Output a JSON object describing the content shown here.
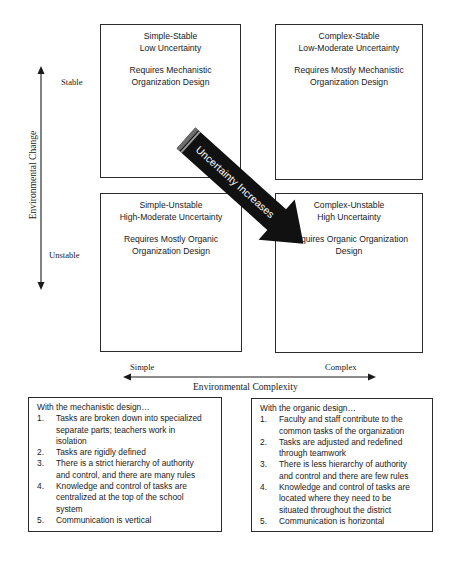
{
  "quadrants": {
    "simple_stable": {
      "title_line1": "Simple-Stable",
      "title_line2": "Low Uncertainty",
      "req_line1": "Requires Mechanistic",
      "req_line2": "Organization Design"
    },
    "complex_stable": {
      "title_line1": "Complex-Stable",
      "title_line2": "Low-Moderate Uncertainty",
      "req_line1": "Requires Mostly Mechanistic",
      "req_line2": "Organization Design"
    },
    "simple_unstable": {
      "title_line1": "Simple-Unstable",
      "title_line2": "High-Moderate Uncertainty",
      "req_line1": "Requires Mostly Organic",
      "req_line2": "Organization Design"
    },
    "complex_unstable": {
      "title_line1": "Complex-Unstable",
      "title_line2": "High Uncertainty",
      "req_line1": "Requires Organic Organization",
      "req_line2": "Design"
    }
  },
  "vertical_axis": {
    "title": "Environmental Change",
    "top_label": "Stable",
    "bottom_label": "Unstable"
  },
  "horizontal_axis": {
    "title": "Environmental Complexity",
    "left_label": "Simple",
    "right_label": "Complex"
  },
  "diagonal_arrow": {
    "label": "Uncertainty Increases",
    "color": "#111111"
  },
  "mechanistic_box": {
    "lead": "With the mechanistic design…",
    "items": [
      {
        "num": "1.",
        "lines": [
          "Tasks are broken down into specialized",
          "separate parts; teachers work in",
          "isolation"
        ]
      },
      {
        "num": "2.",
        "lines": [
          "Tasks are rigidly defined"
        ]
      },
      {
        "num": "3.",
        "lines": [
          "There is a strict hierarchy of authority",
          "and control, and there are many rules"
        ]
      },
      {
        "num": "4.",
        "lines": [
          "Knowledge and control of tasks are",
          "centralized at the top of the school",
          "system"
        ]
      },
      {
        "num": "5.",
        "lines": [
          "Communication is vertical"
        ]
      }
    ]
  },
  "organic_box": {
    "lead": "With the organic design…",
    "items": [
      {
        "num": "1.",
        "lines": [
          "Faculty and staff contribute to the",
          "common tasks of the organization"
        ]
      },
      {
        "num": "2.",
        "lines": [
          "Tasks are adjusted and redefined",
          "through teamwork"
        ]
      },
      {
        "num": "3.",
        "lines": [
          "There is less hierarchy of authority",
          "and control and there are few rules"
        ]
      },
      {
        "num": "4.",
        "lines": [
          "Knowledge and control of tasks are",
          "located where they need to be",
          "situated throughout the district"
        ]
      },
      {
        "num": "5.",
        "lines": [
          "Communication is horizontal"
        ]
      }
    ]
  }
}
